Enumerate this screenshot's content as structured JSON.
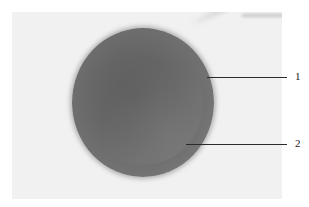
{
  "figure": {
    "labels": [
      {
        "number": "1",
        "y": 77
      },
      {
        "number": "2",
        "y": 144
      }
    ],
    "colors": {
      "background": "#f1f1f1",
      "specimen": "#666666",
      "leader_line": "#2a2a2a"
    }
  }
}
